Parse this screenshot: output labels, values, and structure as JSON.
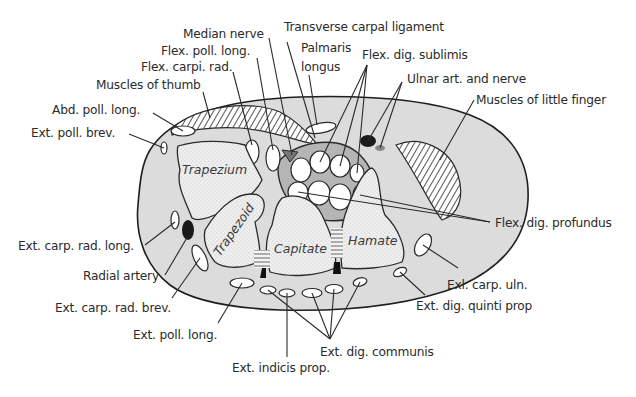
{
  "diagram": {
    "type": "anatomical cross-section",
    "colors": {
      "background": "#ffffff",
      "soft_tissue": "#dcdcdc",
      "bone_fill": "#ececec",
      "tunnel_fill": "#b5b5b5",
      "line": "#2a2a2a",
      "artery": "#1a1a1a"
    },
    "bones": [
      {
        "id": "trapezium",
        "label": "Trapezium"
      },
      {
        "id": "trapezoid",
        "label": "Trapezoid"
      },
      {
        "id": "capitate",
        "label": "Capitate"
      },
      {
        "id": "hamate",
        "label": "Hamate"
      }
    ],
    "labels": {
      "median_nerve": "Median nerve",
      "transverse_carpal_ligament": "Transverse carpal ligament",
      "flex_poll_long": "Flex. poll. long.",
      "palmaris_longus_1": "Palmaris",
      "palmaris_longus_2": "longus",
      "flex_carpi_rad": "Flex. carpi. rad.",
      "flex_dig_sublimis": "Flex. dig. sublimis",
      "muscles_of_thumb": "Muscles of thumb",
      "ulnar_art_nerve": "Ulnar art. and nerve",
      "abd_poll_long": "Abd. poll. long.",
      "muscles_little_finger": "Muscles of little finger",
      "ext_poll_brev": "Ext. poll. brev.",
      "flex_dig_profundus": "Flex. dig. profundus",
      "ext_carp_rad_long": "Ext. carp. rad. long.",
      "radial_artery": "Radial artery",
      "exl_carp_uln": "Exl. carp. uln.",
      "ext_carp_rad_brev": "Ext. carp. rad. brev.",
      "ext_dig_quinti_prop": "Ext. dig. quinti prop",
      "ext_poll_long": "Ext. poll. long.",
      "ext_dig_communis": "Ext. dig. communis",
      "ext_indicis_prop": "Ext. indicis prop."
    }
  }
}
